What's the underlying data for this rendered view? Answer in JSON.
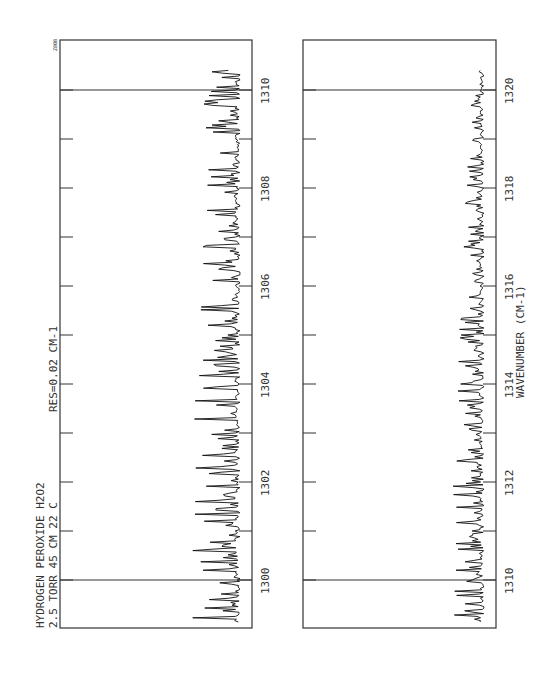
{
  "chart_data": [
    {
      "type": "line",
      "panel": "upper",
      "title": "HYDROGEN PEROXIDE  H2O2",
      "annotations": [
        "2.5 TORR  45 CM  22 C",
        "RES=0.02 CM-1",
        "Z80B"
      ],
      "xlabel": "",
      "ylabel": "",
      "xlim": [
        1299.1,
        1311.0
      ],
      "x_ticks": [
        1300,
        1301,
        1302,
        1303,
        1304,
        1305,
        1306,
        1307,
        1308,
        1309,
        1310
      ],
      "x_tick_labels": [
        "1300",
        "1302",
        "1304",
        "1306",
        "1308",
        "1310"
      ],
      "marker_lines": [
        1300,
        1310
      ],
      "series": [
        {
          "name": "transmission",
          "description": "dense absorption spectrum, many lines",
          "baseline": 0.78,
          "line_depth_range": [
            0.15,
            0.6
          ]
        }
      ],
      "grid": false,
      "orientation": "rotated-90"
    },
    {
      "type": "line",
      "panel": "lower",
      "title": "",
      "xlabel": "WAVENUMBER (CM-1)",
      "ylabel": "",
      "xlim": [
        1309.1,
        1321.0
      ],
      "x_ticks": [
        1310,
        1311,
        1312,
        1313,
        1314,
        1315,
        1316,
        1317,
        1318,
        1319,
        1320
      ],
      "x_tick_labels": [
        "1310",
        "1312",
        "1314",
        "1316",
        "1318",
        "1320"
      ],
      "marker_lines": [
        1310,
        1320
      ],
      "series": [
        {
          "name": "transmission",
          "description": "absorption spectrum, weaker lines at higher wavenumber",
          "baseline": 0.9,
          "line_depth_range": [
            0.05,
            0.4
          ]
        }
      ],
      "grid": false,
      "orientation": "rotated-90"
    }
  ],
  "labels": {
    "sample_line1": "HYDROGEN PEROXIDE  H2O2",
    "sample_line2": "2.5 TORR  45 CM  22 C",
    "resolution": "RES=0.02 CM-1",
    "plot_id": "Z80B",
    "axis_title": "WAVENUMBER (CM-1)"
  }
}
